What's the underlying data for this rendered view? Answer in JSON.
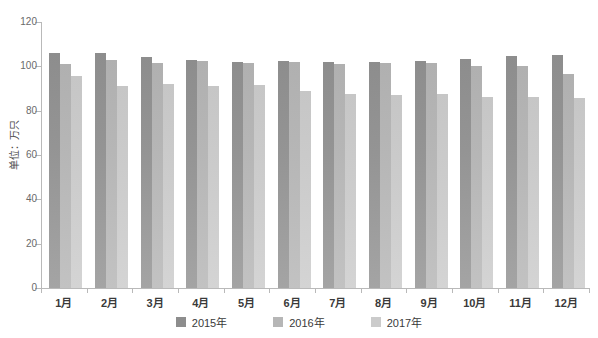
{
  "chart_data": {
    "type": "bar",
    "title": "",
    "subtitle": "",
    "xlabel": "",
    "ylabel": "单位：万只",
    "ylim": [
      0,
      120
    ],
    "yticks": [
      0,
      20,
      40,
      60,
      80,
      100,
      120
    ],
    "ytick_labels": [
      "0",
      "20",
      "40",
      "60",
      "80",
      "100",
      "120"
    ],
    "grid": false,
    "legend_position": "bottom",
    "categories": [
      "1月",
      "2月",
      "3月",
      "4月",
      "5月",
      "6月",
      "7月",
      "8月",
      "9月",
      "10月",
      "11月",
      "12月"
    ],
    "series": [
      {
        "name": "2015年",
        "color": "#8d8d8d",
        "values": [
          106.0,
          106.0,
          104.0,
          103.0,
          102.0,
          102.5,
          102.0,
          102.0,
          102.5,
          103.5,
          104.5,
          105.0
        ]
      },
      {
        "name": "2016年",
        "color": "#b6b6b6",
        "values": [
          101.0,
          103.0,
          101.5,
          102.5,
          101.5,
          102.0,
          101.0,
          101.5,
          101.5,
          100.0,
          100.0,
          96.5
        ]
      },
      {
        "name": "2017年",
        "color": "#cbcbcb",
        "values": [
          95.5,
          91.0,
          92.0,
          91.0,
          91.5,
          89.0,
          87.5,
          87.0,
          87.5,
          86.0,
          86.0,
          85.5
        ]
      }
    ]
  },
  "legend": {
    "items": [
      {
        "label": "2015年",
        "swatch_class": "s0"
      },
      {
        "label": "2016年",
        "swatch_class": "s1"
      },
      {
        "label": "2017年",
        "swatch_class": "s2"
      }
    ]
  }
}
